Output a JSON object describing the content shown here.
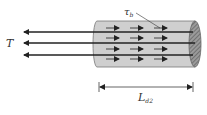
{
  "labels": {
    "tension": "T",
    "bond_stress": "τ",
    "bond_stress_sub": "b",
    "length": "L",
    "length_sub": "d2"
  },
  "colors": {
    "cylinder_fill": "#cfcfcf",
    "cylinder_stroke": "#777777",
    "end_fill": "#8a8a8a",
    "bar": "#222222",
    "arrow": "#222222",
    "background": "#ffffff"
  },
  "bars": {
    "count": 3
  },
  "stress_arrows": {
    "rows": 4,
    "per_row": 3
  }
}
